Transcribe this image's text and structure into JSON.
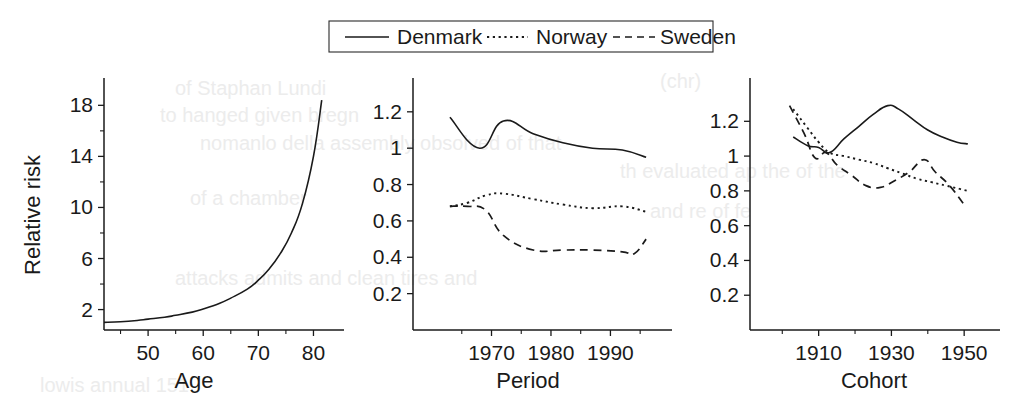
{
  "legend": {
    "position": "top-center",
    "items": [
      {
        "label": "Denmark",
        "style": "solid",
        "name": "legend-item-denmark"
      },
      {
        "label": "Norway",
        "style": "dotted",
        "name": "legend-item-norway"
      },
      {
        "label": "Sweden",
        "style": "dashed",
        "name": "legend-item-sweden"
      }
    ]
  },
  "chart_data": [
    {
      "type": "line",
      "panel": "age",
      "title": "",
      "xlabel": "Age",
      "ylabel": "Relative risk",
      "xlim": [
        42,
        83
      ],
      "ylim": [
        0.4,
        19.2
      ],
      "xticks": [
        50,
        60,
        70,
        80
      ],
      "xticklabels": [
        "50",
        "60",
        "70",
        "80"
      ],
      "xminorticks": [
        45,
        55,
        65,
        75
      ],
      "yticks": [
        2,
        6,
        10,
        14,
        18
      ],
      "yticklabels": [
        "2",
        "6",
        "10",
        "14",
        "18"
      ],
      "yminorticks": [
        4,
        8,
        12,
        16
      ],
      "grid": false,
      "series": [
        {
          "name": "Denmark",
          "style": "solid",
          "x": [
            42,
            45,
            48,
            50,
            53,
            55,
            58,
            60,
            63,
            65,
            68,
            70,
            72,
            74,
            76,
            78,
            80,
            81.5
          ],
          "values": [
            1.0,
            1.05,
            1.15,
            1.25,
            1.4,
            1.55,
            1.8,
            2.05,
            2.5,
            2.9,
            3.6,
            4.3,
            5.2,
            6.4,
            8.0,
            10.3,
            14.0,
            18.4
          ]
        }
      ]
    },
    {
      "type": "line",
      "panel": "period",
      "title": "",
      "xlabel": "Period",
      "ylabel": "",
      "xlim": [
        1961,
        1998
      ],
      "ylim": [
        0,
        1.32
      ],
      "xticks": [
        1970,
        1980,
        1990
      ],
      "xticklabels": [
        "1970",
        "1980",
        "1990"
      ],
      "xminorticks": [
        1965,
        1975,
        1985,
        1995
      ],
      "yticks": [
        0.2,
        0.4,
        0.6,
        0.8,
        1,
        1.2
      ],
      "yticklabels": [
        "0.2",
        "0.4",
        "0.6",
        "0.8",
        "1",
        "1.2"
      ],
      "grid": false,
      "series": [
        {
          "name": "Denmark",
          "style": "solid",
          "x": [
            1963,
            1968,
            1972,
            1977,
            1982,
            1987,
            1992,
            1996
          ],
          "values": [
            1.17,
            1.0,
            1.15,
            1.08,
            1.03,
            1.0,
            0.99,
            0.95
          ]
        },
        {
          "name": "Norway",
          "style": "dotted",
          "x": [
            1963,
            1966,
            1969,
            1972,
            1977,
            1982,
            1987,
            1992,
            1996
          ],
          "values": [
            0.68,
            0.7,
            0.74,
            0.75,
            0.72,
            0.69,
            0.67,
            0.68,
            0.65
          ]
        },
        {
          "name": "Sweden",
          "style": "dashed",
          "x": [
            1963,
            1966,
            1969,
            1972,
            1977,
            1982,
            1987,
            1992,
            1994,
            1996
          ],
          "values": [
            0.68,
            0.68,
            0.66,
            0.52,
            0.44,
            0.44,
            0.44,
            0.43,
            0.42,
            0.5
          ]
        }
      ]
    },
    {
      "type": "line",
      "panel": "cohort",
      "title": "",
      "xlabel": "Cohort",
      "ylabel": "",
      "xlim": [
        1898,
        1956
      ],
      "ylim": [
        0,
        1.38
      ],
      "xticks": [
        1910,
        1930,
        1950
      ],
      "xticklabels": [
        "1910",
        "1930",
        "1950"
      ],
      "xminorticks": [
        1900,
        1920,
        1940
      ],
      "yticks": [
        0.2,
        0.4,
        0.6,
        0.8,
        1,
        1.2
      ],
      "yticklabels": [
        "0.2",
        "0.4",
        "0.6",
        "0.8",
        "1",
        "1.2"
      ],
      "grid": false,
      "series": [
        {
          "name": "Denmark",
          "style": "solid",
          "x": [
            1903,
            1907,
            1910,
            1913,
            1917,
            1921,
            1925,
            1929,
            1932,
            1936,
            1940,
            1944,
            1948,
            1951
          ],
          "values": [
            1.11,
            1.06,
            1.05,
            1.02,
            1.1,
            1.17,
            1.24,
            1.29,
            1.27,
            1.21,
            1.15,
            1.11,
            1.08,
            1.07
          ]
        },
        {
          "name": "Norway",
          "style": "dotted",
          "x": [
            1903,
            1907,
            1910,
            1913,
            1917,
            1921,
            1925,
            1929,
            1933,
            1937,
            1941,
            1945,
            1949,
            1951
          ],
          "values": [
            1.27,
            1.16,
            1.08,
            1.02,
            1.0,
            0.98,
            0.96,
            0.93,
            0.9,
            0.87,
            0.85,
            0.83,
            0.81,
            0.8
          ]
        },
        {
          "name": "Sweden",
          "style": "dashed",
          "x": [
            1902,
            1906,
            1909,
            1912,
            1915,
            1919,
            1923,
            1927,
            1931,
            1935,
            1939,
            1942,
            1946,
            1950
          ],
          "values": [
            1.29,
            1.13,
            0.99,
            1.02,
            0.95,
            0.89,
            0.83,
            0.82,
            0.86,
            0.91,
            0.98,
            0.91,
            0.83,
            0.72
          ]
        }
      ]
    }
  ],
  "background_bleed": [
    {
      "text": "(chr)",
      "x": 660,
      "y": 88
    },
    {
      "text": "of Staphan Lundi",
      "x": 175,
      "y": 95
    },
    {
      "text": "to hanged given bregn",
      "x": 160,
      "y": 122
    },
    {
      "text": "nomanlo della assembly obsolved of that",
      "x": 200,
      "y": 150
    },
    {
      "text": "th evaluated ap the of the",
      "x": 620,
      "y": 178
    },
    {
      "text": "of a chamber",
      "x": 190,
      "y": 205
    },
    {
      "text": "and re of fe",
      "x": 650,
      "y": 218
    },
    {
      "text": "attacks  admits   and   clean   tires   and",
      "x": 175,
      "y": 285
    },
    {
      "text": "lowis annual 151",
      "x": 40,
      "y": 392
    }
  ]
}
